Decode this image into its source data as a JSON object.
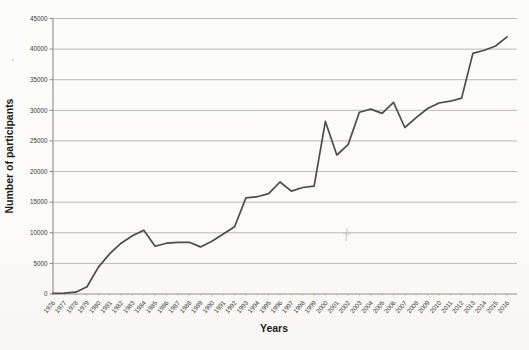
{
  "chart_data": {
    "type": "line",
    "title": "",
    "xlabel": "Years",
    "ylabel": "Number of participants",
    "x": [
      1976,
      1977,
      1978,
      1979,
      1980,
      1981,
      1982,
      1983,
      1984,
      1985,
      1986,
      1987,
      1988,
      1989,
      1990,
      1991,
      1992,
      1993,
      1994,
      1995,
      1996,
      1997,
      1998,
      1999,
      2000,
      2001,
      2002,
      2003,
      2004,
      2005,
      2006,
      2007,
      2008,
      2009,
      2010,
      2011,
      2012,
      2013,
      2014,
      2015,
      2016
    ],
    "values": [
      100,
      150,
      300,
      1200,
      4400,
      6600,
      8300,
      9500,
      10400,
      7800,
      8300,
      8450,
      8450,
      7700,
      8600,
      9800,
      11000,
      15700,
      15900,
      16400,
      18300,
      16800,
      17400,
      17600,
      28200,
      22700,
      24400,
      29700,
      30200,
      29500,
      31300,
      27200,
      28800,
      30300,
      31200,
      31500,
      32000,
      39300,
      39800,
      40500,
      42000
    ],
    "ylim": [
      0,
      45000
    ],
    "yticks": [
      0,
      5000,
      10000,
      15000,
      20000,
      25000,
      30000,
      35000,
      40000,
      45000
    ],
    "grid": "horizontal",
    "legend": "none",
    "series_name": "Number of participants",
    "colors": {
      "line": "#4c4c4c",
      "gridline": "#b9b9b5",
      "axis": "#8d8d8a",
      "tick_text": "#3a3a38",
      "background": "#fcfbf9"
    }
  }
}
